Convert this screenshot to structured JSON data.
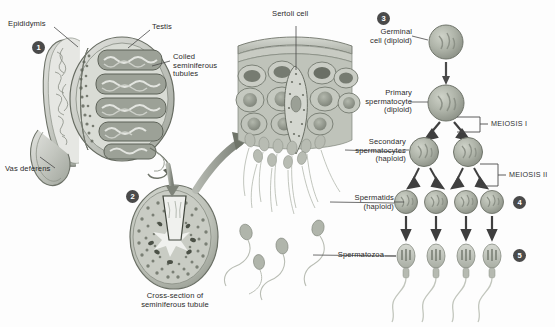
{
  "figure": {
    "background_color": "#fdfdfd",
    "ink_color": "#2b2b2b",
    "cell_fill": "#b9bdb4",
    "cell_stroke": "#6e7268"
  },
  "panels": {
    "testis": {
      "marker": "1",
      "labels": {
        "epididymis": "Epididymis",
        "testis": "Testis",
        "coiled_tubules": "Coiled\nseminiferous\ntubules",
        "vas_deferens": "Vas deferens"
      }
    },
    "cross_section": {
      "marker": "2",
      "caption": "Cross-section of\nseminiferous tubule"
    },
    "tubule_wall": {
      "labels": {
        "sertoli": "Sertoli cell"
      }
    },
    "lineage": {
      "marker_spermatids": "4",
      "marker_spermatozoa": "5",
      "marker_germinal": "3",
      "labels": {
        "germinal": "Germinal\ncell (diploid)",
        "primary": "Primary\nspermatocyte\n(diploid)",
        "secondary": "Secondary\nspermatocytes\n(haploid)",
        "spermatids": "Spermatids\n(haploid)",
        "spermatozoa": "Spermatozoa",
        "meiosis_1": "MEIOSIS I",
        "meiosis_2": "MEIOSIS II"
      }
    }
  }
}
